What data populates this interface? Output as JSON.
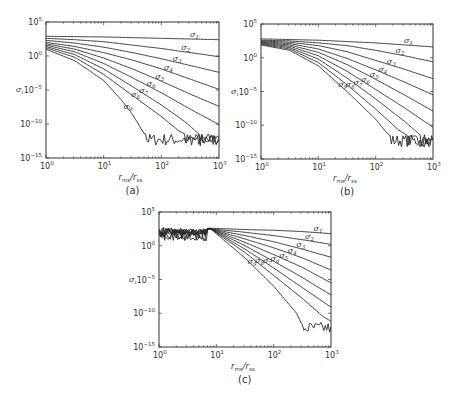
{
  "figure": {
    "panels": [
      {
        "id": "a",
        "caption": "(a)"
      },
      {
        "id": "b",
        "caption": "(b)"
      },
      {
        "id": "c",
        "caption": "(c)"
      }
    ],
    "xlabel_main": "r",
    "xlabel_sub1": "ms",
    "xlabel_mid": "/r",
    "xlabel_sub2": "ss",
    "ylabel_main": "σ",
    "ylabel_sub": "i",
    "x_ticks": [
      {
        "base": "10",
        "exp": "0"
      },
      {
        "base": "10",
        "exp": "1"
      },
      {
        "base": "10",
        "exp": "2"
      },
      {
        "base": "10",
        "exp": "3"
      }
    ],
    "y_ticks": [
      {
        "base": "10",
        "exp": "5"
      },
      {
        "base": "10",
        "exp": "0"
      },
      {
        "base": "10",
        "exp": "−5"
      },
      {
        "base": "10",
        "exp": "−10"
      },
      {
        "base": "10",
        "exp": "−15"
      }
    ],
    "series_labels": [
      "σ1",
      "σ2",
      "σ3",
      "σ4",
      "σ5",
      "σ6",
      "σ7",
      "σ8",
      "σ9"
    ]
  },
  "chart_data": [
    {
      "type": "line",
      "panel": "(a)",
      "title": "",
      "xlabel": "r_ms/r_ss",
      "ylabel": "σ_i",
      "xscale": "log",
      "yscale": "log",
      "xlim": [
        1,
        1000
      ],
      "ylim": [
        1e-15,
        100000.0
      ],
      "x_ticks": [
        "10^0",
        "10^1",
        "10^2",
        "10^3"
      ],
      "y_ticks": [
        "10^-15",
        "10^-10",
        "10^-5",
        "10^0",
        "10^5"
      ],
      "noise_floor_log10": -12.3,
      "series": [
        {
          "name": "σ1",
          "log10_x": [
            0,
            0.5,
            1,
            1.5,
            2,
            2.5,
            3
          ],
          "log10_y": [
            2.9,
            2.85,
            2.8,
            2.7,
            2.6,
            2.5,
            2.4
          ]
        },
        {
          "name": "σ2",
          "log10_x": [
            0,
            0.5,
            1,
            1.5,
            2,
            2.5,
            3
          ],
          "log10_y": [
            2.6,
            2.4,
            2.1,
            1.6,
            1.1,
            0.5,
            -0.1
          ]
        },
        {
          "name": "σ3",
          "log10_x": [
            0,
            0.5,
            1,
            1.5,
            2,
            2.5,
            3
          ],
          "log10_y": [
            2.3,
            1.9,
            1.3,
            0.5,
            -0.4,
            -1.4,
            -2.4
          ]
        },
        {
          "name": "σ4",
          "log10_x": [
            0,
            0.5,
            1,
            1.5,
            2,
            2.5,
            3
          ],
          "log10_y": [
            2.0,
            1.4,
            0.5,
            -0.6,
            -1.9,
            -3.4,
            -4.9
          ]
        },
        {
          "name": "σ5",
          "log10_x": [
            0,
            0.5,
            1,
            1.5,
            2,
            2.5,
            3
          ],
          "log10_y": [
            1.8,
            1.0,
            -0.3,
            -1.9,
            -3.7,
            -5.6,
            -7.4
          ]
        },
        {
          "name": "σ6",
          "log10_x": [
            0,
            0.5,
            1,
            1.5,
            2,
            2.5,
            3
          ],
          "log10_y": [
            1.6,
            0.6,
            -1.1,
            -3.2,
            -5.4,
            -7.8,
            -10.1
          ]
        },
        {
          "name": "σ7",
          "log10_x": [
            0,
            0.5,
            1,
            1.5,
            2,
            2.4,
            2.7,
            3
          ],
          "log10_y": [
            1.4,
            0.2,
            -1.9,
            -4.5,
            -7.2,
            -9.6,
            -11.8,
            -12.1
          ]
        },
        {
          "name": "σ8",
          "log10_x": [
            0,
            0.5,
            1,
            1.5,
            2,
            2.3,
            2.6,
            3
          ],
          "log10_y": [
            1.2,
            -0.2,
            -2.7,
            -5.8,
            -8.9,
            -11.0,
            -12.3,
            -12.2
          ]
        },
        {
          "name": "σ9",
          "log10_x": [
            0,
            0.5,
            1,
            1.3,
            1.5,
            1.7,
            2,
            3
          ],
          "log10_y": [
            1.0,
            -0.7,
            -3.6,
            -6.4,
            -8.6,
            -11.4,
            -12.3,
            -12.1
          ]
        }
      ]
    },
    {
      "type": "line",
      "panel": "(b)",
      "title": "",
      "xlabel": "r_ms/r_ss",
      "ylabel": "σ_i",
      "xscale": "log",
      "yscale": "log",
      "xlim": [
        1,
        1000
      ],
      "ylim": [
        1e-15,
        100000.0
      ],
      "x_ticks": [
        "10^0",
        "10^1",
        "10^2",
        "10^3"
      ],
      "y_ticks": [
        "10^-15",
        "10^-10",
        "10^-5",
        "10^0",
        "10^5"
      ],
      "noise_floor_log10": -12.3,
      "series": [
        {
          "name": "σ1",
          "log10_x": [
            0,
            0.5,
            1,
            1.5,
            2,
            2.5,
            3
          ],
          "log10_y": [
            2.8,
            2.7,
            2.6,
            2.4,
            2.2,
            1.9,
            1.6
          ]
        },
        {
          "name": "σ2",
          "log10_x": [
            0,
            0.5,
            1,
            1.5,
            2,
            2.5,
            3
          ],
          "log10_y": [
            2.6,
            2.5,
            2.2,
            1.8,
            1.1,
            0.3,
            -0.6
          ]
        },
        {
          "name": "σ3",
          "log10_x": [
            0,
            0.5,
            1,
            1.5,
            2,
            2.5,
            3
          ],
          "log10_y": [
            2.5,
            2.3,
            1.8,
            0.9,
            -0.4,
            -1.7,
            -3.1
          ]
        },
        {
          "name": "σ4",
          "log10_x": [
            0,
            0.5,
            1,
            1.5,
            2,
            2.5,
            3
          ],
          "log10_y": [
            2.4,
            2.1,
            1.3,
            -0.1,
            -1.8,
            -3.6,
            -5.5
          ]
        },
        {
          "name": "σ5",
          "log10_x": [
            0,
            0.5,
            1,
            1.5,
            2,
            2.5,
            3
          ],
          "log10_y": [
            2.3,
            1.9,
            0.8,
            -1.0,
            -3.2,
            -5.5,
            -7.9
          ]
        },
        {
          "name": "σ6",
          "log10_x": [
            0,
            0.5,
            1,
            1.5,
            2,
            2.5,
            3
          ],
          "log10_y": [
            2.2,
            1.7,
            0.3,
            -2.0,
            -4.7,
            -7.4,
            -10.3
          ]
        },
        {
          "name": "σ7",
          "log10_x": [
            0,
            0.5,
            1,
            1.5,
            2,
            2.5,
            2.8,
            3
          ],
          "log10_y": [
            2.1,
            1.5,
            -0.2,
            -3.0,
            -6.1,
            -9.4,
            -11.6,
            -12.0
          ]
        },
        {
          "name": "σ8",
          "log10_x": [
            0,
            0.5,
            1,
            1.5,
            2,
            2.4,
            2.7,
            3
          ],
          "log10_y": [
            2.0,
            1.3,
            -0.7,
            -4.0,
            -7.6,
            -10.7,
            -12.3,
            -12.2
          ]
        },
        {
          "name": "σ9",
          "log10_x": [
            0,
            0.5,
            1,
            1.5,
            2,
            2.2,
            2.4,
            3
          ],
          "log10_y": [
            1.9,
            1.1,
            -1.2,
            -5.0,
            -9.1,
            -11.2,
            -12.4,
            -12.2
          ]
        }
      ]
    },
    {
      "type": "line",
      "panel": "(c)",
      "title": "",
      "xlabel": "r_ms/r_ss",
      "ylabel": "σ_i",
      "xscale": "log",
      "yscale": "log",
      "xlim": [
        1,
        1000
      ],
      "ylim": [
        1e-15,
        100000.0
      ],
      "x_ticks": [
        "10^0",
        "10^1",
        "10^2",
        "10^3"
      ],
      "y_ticks": [
        "10^-15",
        "10^-10",
        "10^-5",
        "10^0",
        "10^5"
      ],
      "noise_floor_log10": -12.2,
      "note": "Curves are noisy and overlapping for r_ms/r_ss < ~8, then diverge",
      "series": [
        {
          "name": "σ1",
          "log10_x": [
            0,
            0.9,
            1.5,
            2,
            2.5,
            3
          ],
          "log10_y": [
            2.8,
            2.6,
            2.4,
            2.3,
            2.1,
            1.8
          ]
        },
        {
          "name": "σ2",
          "log10_x": [
            0,
            0.9,
            1.5,
            2,
            2.5,
            3
          ],
          "log10_y": [
            2.7,
            2.5,
            2.0,
            1.5,
            0.9,
            0.2
          ]
        },
        {
          "name": "σ3",
          "log10_x": [
            0,
            0.9,
            1.5,
            2,
            2.5,
            3
          ],
          "log10_y": [
            2.6,
            2.5,
            1.5,
            0.6,
            -0.5,
            -1.7
          ]
        },
        {
          "name": "σ4",
          "log10_x": [
            0,
            0.9,
            1.5,
            2,
            2.5,
            3
          ],
          "log10_y": [
            2.6,
            2.5,
            1.0,
            -0.3,
            -1.8,
            -3.6
          ]
        },
        {
          "name": "σ5",
          "log10_x": [
            0,
            0.9,
            1.5,
            2,
            2.5,
            3
          ],
          "log10_y": [
            2.5,
            2.5,
            0.5,
            -1.3,
            -3.2,
            -5.5
          ]
        },
        {
          "name": "σ6",
          "log10_x": [
            0,
            0.9,
            1.5,
            2,
            2.5,
            3
          ],
          "log10_y": [
            2.5,
            2.5,
            0.0,
            -2.3,
            -4.7,
            -7.3
          ]
        },
        {
          "name": "σ7",
          "log10_x": [
            0,
            0.9,
            1.5,
            2,
            2.5,
            3
          ],
          "log10_y": [
            2.4,
            2.5,
            -0.5,
            -3.3,
            -6.2,
            -9.1
          ]
        },
        {
          "name": "σ8",
          "log10_x": [
            0,
            0.9,
            1.5,
            2,
            2.5,
            2.85,
            3
          ],
          "log10_y": [
            2.3,
            2.5,
            -1.0,
            -4.4,
            -7.8,
            -10.4,
            -11.2
          ]
        },
        {
          "name": "σ9",
          "log10_x": [
            0,
            0.9,
            1.5,
            2,
            2.4,
            2.5,
            3
          ],
          "log10_y": [
            2.2,
            2.5,
            -1.8,
            -6.0,
            -10.0,
            -11.8,
            -12.0
          ]
        }
      ]
    }
  ]
}
